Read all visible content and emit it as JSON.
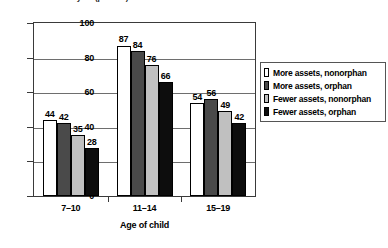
{
  "chart_data": {
    "type": "bar",
    "title": "Enrollment rate last year (percent)",
    "xlabel": "Age of child",
    "ylabel": "",
    "ylim": [
      0,
      100
    ],
    "yticks": [
      0,
      20,
      40,
      60,
      80,
      100
    ],
    "grid": true,
    "legend_position": "right",
    "categories": [
      "7–10",
      "11–14",
      "15–19"
    ],
    "series": [
      {
        "name": "More assets, nonorphan",
        "color": "#ffffff",
        "values": [
          44,
          87,
          54
        ]
      },
      {
        "name": "More assets, orphan",
        "color": "#4a4a4a",
        "values": [
          42,
          84,
          56
        ]
      },
      {
        "name": "Fewer assets, nonorphan",
        "color": "#c0c0c0",
        "values": [
          35,
          76,
          49
        ]
      },
      {
        "name": "Fewer assets, orphan",
        "color": "#0d0d0d",
        "values": [
          28,
          66,
          42
        ]
      }
    ]
  }
}
